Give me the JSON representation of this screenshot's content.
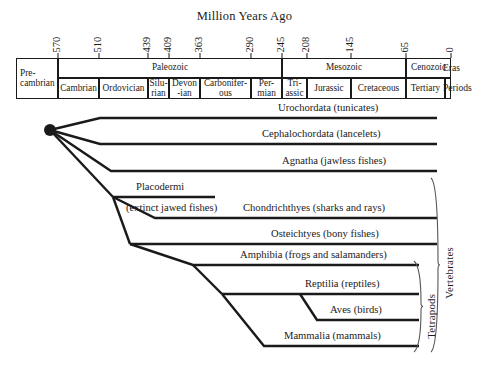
{
  "title": "Million Years Ago",
  "axis": {
    "ticks": [
      {
        "value": "570",
        "x": 58
      },
      {
        "value": "510",
        "x": 99
      },
      {
        "value": "439",
        "x": 148
      },
      {
        "value": "409",
        "x": 169
      },
      {
        "value": "363",
        "x": 200
      },
      {
        "value": "290",
        "x": 251
      },
      {
        "value": "245",
        "x": 282
      },
      {
        "value": "208",
        "x": 307
      },
      {
        "value": "145",
        "x": 351
      },
      {
        "value": "65",
        "x": 406
      },
      {
        "value": "0",
        "x": 451
      }
    ],
    "row_labels": {
      "eras": "Eras",
      "periods": "Periods"
    }
  },
  "eras": [
    {
      "label": "Pre-\ncambrian",
      "x": 16,
      "w": 42
    },
    {
      "label": "Paleozoic",
      "x": 58,
      "w": 224
    },
    {
      "label": "Mesozoic",
      "x": 282,
      "w": 124
    },
    {
      "label": "Cenozoic",
      "x": 406,
      "w": 45
    }
  ],
  "periods": [
    {
      "label": "Cambrian",
      "x": 58,
      "w": 41
    },
    {
      "label": "Ordovician",
      "x": 99,
      "w": 49
    },
    {
      "label": "Silu-\nrian",
      "x": 148,
      "w": 21
    },
    {
      "label": "Devon\n-ian",
      "x": 169,
      "w": 31
    },
    {
      "label": "Carbonifer-\nous",
      "x": 200,
      "w": 51
    },
    {
      "label": "Per-\nmian",
      "x": 251,
      "w": 31
    },
    {
      "label": "Tri-\nassic",
      "x": 282,
      "w": 25
    },
    {
      "label": "Jurassic",
      "x": 307,
      "w": 44
    },
    {
      "label": "Cretaceous",
      "x": 351,
      "w": 55
    },
    {
      "label": "Tertiary",
      "x": 406,
      "w": 39
    },
    {
      "label": "",
      "x": 445,
      "w": 6
    }
  ],
  "taxa": [
    {
      "name": "Urochordata (tunicates)",
      "label_x": 278,
      "label_y": 102,
      "align": "right",
      "tip_y": 118,
      "tip_x": 437,
      "start_x": 100
    },
    {
      "name": "Cephalochordata (lancelets)",
      "label_x": 262,
      "label_y": 128,
      "align": "right",
      "tip_y": 144,
      "tip_x": 437,
      "start_x": 100
    },
    {
      "name": "Agnatha (jawless fishes)",
      "label_x": 282,
      "label_y": 155,
      "align": "right",
      "tip_y": 171,
      "tip_x": 437,
      "start_x": 111
    },
    {
      "name": "Placodermi",
      "label_x": 136,
      "label_y": 181,
      "align": "left",
      "tip_y": 197,
      "tip_x": 215,
      "start_x": 113
    },
    {
      "name": "(extinct jawed fishes)",
      "label_x": 126,
      "label_y": 202,
      "align": "left"
    },
    {
      "name": "Chondrichthyes (sharks and rays)",
      "label_x": 243,
      "label_y": 202,
      "align": "right",
      "tip_y": 218,
      "tip_x": 437,
      "start_x": 155
    },
    {
      "name": "Osteichtyes (bony fishes)",
      "label_x": 271,
      "label_y": 228,
      "align": "right",
      "tip_y": 244,
      "tip_x": 437,
      "start_x": 130
    },
    {
      "name": "Amphibia (frogs and salamanders)",
      "label_x": 240,
      "label_y": 249,
      "align": "right",
      "tip_y": 265,
      "tip_x": 419,
      "start_x": 193
    },
    {
      "name": "Reptilia (reptiles)",
      "label_x": 305,
      "label_y": 278,
      "align": "right",
      "tip_y": 294,
      "tip_x": 419,
      "start_x": 222
    },
    {
      "name": "Aves (birds)",
      "label_x": 330,
      "label_y": 304,
      "align": "right",
      "tip_y": 320,
      "tip_x": 419,
      "start_x": 317
    },
    {
      "name": "Mammalia (mammals)",
      "label_x": 284,
      "label_y": 330,
      "align": "right",
      "tip_y": 346,
      "tip_x": 419,
      "start_x": 264
    }
  ],
  "brackets": [
    {
      "label": "Vertebrates",
      "x": 438,
      "top": 178,
      "bottom": 352,
      "label_x": 455,
      "label_y": 298
    },
    {
      "label": "Tetrapods",
      "x": 421,
      "top": 261,
      "bottom": 352,
      "label_x": 437,
      "label_y": 338
    }
  ],
  "root_node": {
    "x": 50,
    "y": 130,
    "r": 6
  },
  "colors": {
    "line": "#1a1a1a",
    "background": "#ffffff",
    "text": "#1a1a1a"
  }
}
